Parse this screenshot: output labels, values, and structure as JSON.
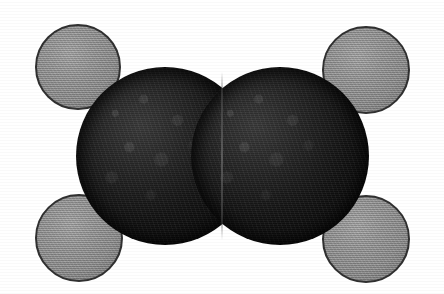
{
  "figure": {
    "molecule_name": "Ethylene",
    "molecular_formula": "C2H4",
    "model_type": "space-filling (CPK) model",
    "background_color": "#ffffff",
    "width": 444,
    "height": 294,
    "rendering": "scanned halftone black-and-white photograph"
  },
  "legend": {
    "carbon_label": "Carbon",
    "carbon_color": "#121212",
    "hydrogen_label": "Hydrogen",
    "hydrogen_color": "#8b8b8b",
    "outline_color": "#303030"
  },
  "atoms": [
    {
      "id": "hydrogen-top-left",
      "element": "H",
      "label": "H",
      "role": "hydrogen",
      "cx": 78,
      "cy": 67,
      "r": 43,
      "color": "#8b8b8b"
    },
    {
      "id": "hydrogen-top-right",
      "element": "H",
      "label": "H",
      "role": "hydrogen",
      "cx": 366,
      "cy": 70,
      "r": 44,
      "color": "#8b8b8b"
    },
    {
      "id": "hydrogen-bottom-left",
      "element": "H",
      "label": "H",
      "role": "hydrogen",
      "cx": 79,
      "cy": 238,
      "r": 44,
      "color": "#8b8b8b"
    },
    {
      "id": "hydrogen-bottom-right",
      "element": "H",
      "label": "H",
      "role": "hydrogen",
      "cx": 366,
      "cy": 239,
      "r": 44,
      "color": "#8b8b8b"
    },
    {
      "id": "carbon-left",
      "element": "C",
      "label": "C",
      "role": "carbon",
      "cx": 165,
      "cy": 156,
      "r": 89,
      "color": "#121212"
    },
    {
      "id": "carbon-right",
      "element": "C",
      "label": "C",
      "role": "carbon",
      "cx": 280,
      "cy": 156,
      "r": 89,
      "color": "#121212"
    }
  ],
  "bonds": [
    {
      "id": "carbon-carbon-bond",
      "from": "carbon-left",
      "to": "carbon-right",
      "order": 2,
      "label": "C=C double bond",
      "seam_x": 222,
      "seam_top": 72,
      "seam_height": 168
    }
  ]
}
